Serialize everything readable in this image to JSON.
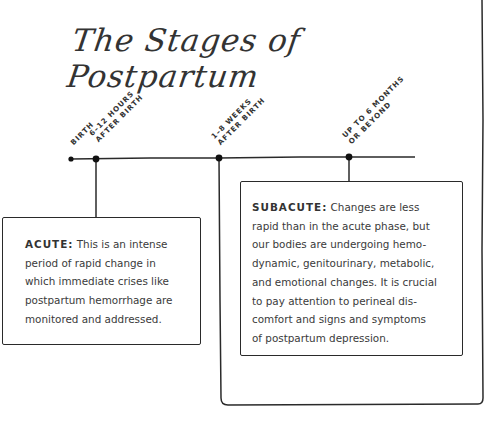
{
  "title": "The Stages of Postpartum",
  "timeline": {
    "markers": [
      {
        "line1": "BIRTH",
        "line2": ""
      },
      {
        "line1": "6–12 HOURS",
        "line2": "AFTER BIRTH"
      },
      {
        "line1": "1–8 WEEKS",
        "line2": "AFTER BIRTH"
      },
      {
        "line1": "UP TO 6 MONTHS",
        "line2": "OR BEYOND"
      }
    ]
  },
  "stages": {
    "acute": {
      "heading": "ACUTE:",
      "lines": [
        "This is an intense",
        "period of rapid change in",
        "which immediate crises like",
        "postpartum hemorrhage are",
        "monitored and addressed."
      ]
    },
    "subacute": {
      "heading": "SUBACUTE:",
      "lines": [
        "Changes are less",
        "rapid than in the acute phase, but",
        "our bodies are undergoing hemo-",
        "dynamic, genitourinary, metabolic,",
        "and emotional changes. It is crucial",
        "to pay attention to perineal dis-",
        "comfort and signs and symptoms",
        "of postpartum depression."
      ]
    }
  }
}
